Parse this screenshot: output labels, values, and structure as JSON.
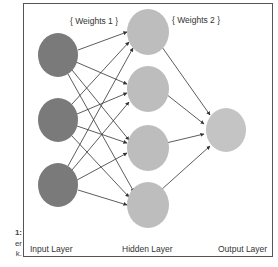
{
  "caption": {
    "lines": [
      "1:",
      "er",
      "k."
    ]
  },
  "diagram": {
    "weight_labels": {
      "weights1": "{ Weights 1 }",
      "weights2": "{ Weights 2 }"
    },
    "layer_labels": {
      "input": "Input Layer",
      "hidden": "Hidden Layer",
      "output": "Output Layer"
    },
    "colors": {
      "input_node": "#7a7a7a",
      "hidden_node": "#bdbdbd",
      "output_node": "#c4c4c4",
      "edge": "#333333",
      "frame": "#555555"
    },
    "layers": [
      {
        "name": "input",
        "nodes": 3
      },
      {
        "name": "hidden",
        "nodes": 4
      },
      {
        "name": "output",
        "nodes": 1
      }
    ],
    "connections": "fully-connected"
  }
}
